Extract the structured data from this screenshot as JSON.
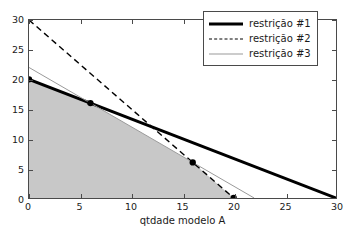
{
  "chart_data": {
    "type": "line",
    "title": "",
    "xlabel": "qtdade modelo A",
    "ylabel": "qtdade modelo B",
    "xlim": [
      0,
      30
    ],
    "ylim": [
      0,
      30
    ],
    "xticks": [
      0,
      5,
      10,
      15,
      20,
      25,
      30
    ],
    "yticks": [
      0,
      5,
      10,
      15,
      20,
      25,
      30
    ],
    "grid": false,
    "legend_position": "upper right",
    "series": [
      {
        "name": "restrição #1",
        "style": "solid-thick",
        "color": "#000000",
        "x": [
          0,
          30
        ],
        "y": [
          20,
          0
        ]
      },
      {
        "name": "restrição #2",
        "style": "dashed",
        "color": "#000000",
        "x": [
          0,
          20
        ],
        "y": [
          30,
          0
        ]
      },
      {
        "name": "restrição #3",
        "style": "solid-thin",
        "color": "#9a9a9a",
        "x": [
          0,
          22
        ],
        "y": [
          22,
          0
        ]
      }
    ],
    "feasible_region": {
      "fill_color": "#c8c8c8",
      "vertices": [
        [
          0,
          0
        ],
        [
          0,
          20
        ],
        [
          6,
          16
        ],
        [
          16,
          6
        ],
        [
          20,
          0
        ]
      ]
    },
    "vertex_markers": [
      {
        "x": 0,
        "y": 20
      },
      {
        "x": 6,
        "y": 16
      },
      {
        "x": 16,
        "y": 6
      },
      {
        "x": 20,
        "y": 0
      }
    ]
  },
  "axes": {
    "x_title": "qtdade modelo A",
    "y_title": "qtdade modelo B",
    "x_tick_labels": [
      "0",
      "5",
      "10",
      "15",
      "20",
      "25",
      "30"
    ],
    "y_tick_labels": [
      "0",
      "5",
      "10",
      "15",
      "20",
      "25",
      "30"
    ]
  },
  "legend": {
    "entries": [
      {
        "label": "restrição #1"
      },
      {
        "label": "restrição #2"
      },
      {
        "label": "restrição #3"
      }
    ]
  }
}
